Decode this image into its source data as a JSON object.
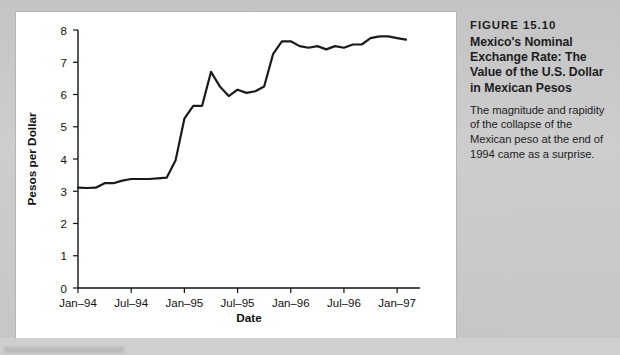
{
  "caption": {
    "figure_number": "FIGURE 15.10",
    "title": "Mexico's Nominal Exchange Rate: The Value of the U.S. Dollar in Mexican Pesos",
    "body": "The magnitude and rapidity of the collapse of the Mexican peso at the end of 1994 came as a surprise."
  },
  "colors": {
    "line": "#1a1a1a",
    "axis": "#111111",
    "panel": "#ffffff",
    "page_background": "#c9c9c9"
  },
  "chart_data": {
    "type": "line",
    "title": "",
    "xlabel": "Date",
    "ylabel": "Pesos per Dollar",
    "ylim": [
      0,
      8
    ],
    "yticks": [
      0,
      1,
      2,
      3,
      4,
      5,
      6,
      7,
      8
    ],
    "ytick_labels": [
      "0",
      "1",
      "2",
      "3",
      "4",
      "5",
      "6",
      "7",
      "8"
    ],
    "xlim": [
      "Jan-94",
      "Feb-97"
    ],
    "xticks": [
      "Jan-94",
      "Jul-94",
      "Jan-95",
      "Jul-95",
      "Jan-96",
      "Jul-96",
      "Jan-97"
    ],
    "xtick_labels": [
      "Jan–94",
      "Jul–94",
      "Jan–95",
      "Jul–95",
      "Jan–96",
      "Jul–96",
      "Jan–97"
    ],
    "grid": false,
    "legend": false,
    "series": [
      {
        "name": "Pesos per U.S. Dollar",
        "x": [
          "Jan-94",
          "Feb-94",
          "Mar-94",
          "Apr-94",
          "May-94",
          "Jun-94",
          "Jul-94",
          "Aug-94",
          "Sep-94",
          "Oct-94",
          "Nov-94",
          "Dec-94",
          "Jan-95",
          "Feb-95",
          "Mar-95",
          "Apr-95",
          "May-95",
          "Jun-95",
          "Jul-95",
          "Aug-95",
          "Sep-95",
          "Oct-95",
          "Nov-95",
          "Dec-95",
          "Jan-96",
          "Feb-96",
          "Mar-96",
          "Apr-96",
          "May-96",
          "Jun-96",
          "Jul-96",
          "Aug-96",
          "Sep-96",
          "Oct-96",
          "Nov-96",
          "Dec-96",
          "Jan-97",
          "Feb-97"
        ],
        "values": [
          3.11,
          3.1,
          3.11,
          3.25,
          3.25,
          3.33,
          3.38,
          3.38,
          3.38,
          3.4,
          3.42,
          3.95,
          5.25,
          5.65,
          5.65,
          6.7,
          6.25,
          5.95,
          6.15,
          6.05,
          6.1,
          6.25,
          7.25,
          7.65,
          7.65,
          7.5,
          7.45,
          7.5,
          7.4,
          7.5,
          7.45,
          7.55,
          7.55,
          7.75,
          7.8,
          7.8,
          7.75,
          7.7
        ]
      }
    ]
  }
}
